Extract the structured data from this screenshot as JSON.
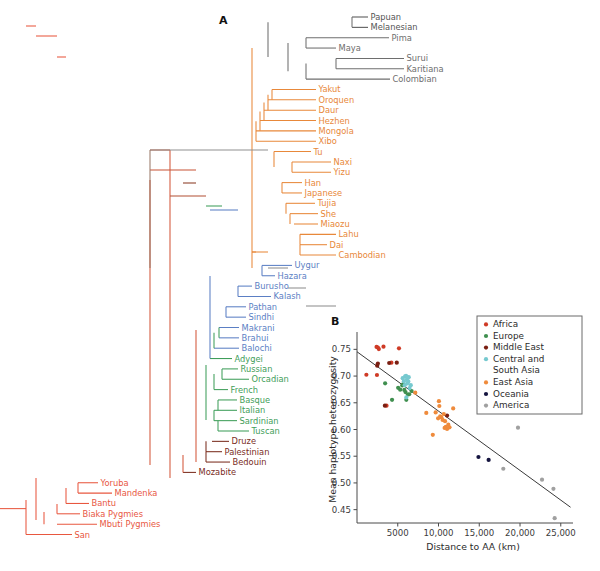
{
  "figure": {
    "panel_a_label": "A",
    "panel_b_label": "B"
  },
  "tree": {
    "regions": {
      "Africa": "#e8573f",
      "Europe": "#3f9e5a",
      "Middle East": "#7a2d1e",
      "Central and South Asia": "#5b7fc4",
      "East Asia": "#e8883a",
      "Oceania": "#555555",
      "America": "#6e6e6e"
    },
    "tips": [
      {
        "name": "Papuan",
        "region": "Oceania"
      },
      {
        "name": "Melanesian",
        "region": "Oceania"
      },
      {
        "name": "Pima",
        "region": "America"
      },
      {
        "name": "Maya",
        "region": "America"
      },
      {
        "name": "Surui",
        "region": "America"
      },
      {
        "name": "Karitiana",
        "region": "America"
      },
      {
        "name": "Colombian",
        "region": "America"
      },
      {
        "name": "Yakut",
        "region": "East Asia"
      },
      {
        "name": "Oroquen",
        "region": "East Asia"
      },
      {
        "name": "Daur",
        "region": "East Asia"
      },
      {
        "name": "Hezhen",
        "region": "East Asia"
      },
      {
        "name": "Mongola",
        "region": "East Asia"
      },
      {
        "name": "Xibo",
        "region": "East Asia"
      },
      {
        "name": "Tu",
        "region": "East Asia"
      },
      {
        "name": "Naxi",
        "region": "East Asia"
      },
      {
        "name": "Yizu",
        "region": "East Asia"
      },
      {
        "name": "Han",
        "region": "East Asia"
      },
      {
        "name": "Japanese",
        "region": "East Asia"
      },
      {
        "name": "Tujia",
        "region": "East Asia"
      },
      {
        "name": "She",
        "region": "East Asia"
      },
      {
        "name": "Miaozu",
        "region": "East Asia"
      },
      {
        "name": "Lahu",
        "region": "East Asia"
      },
      {
        "name": "Dai",
        "region": "East Asia"
      },
      {
        "name": "Cambodian",
        "region": "East Asia"
      },
      {
        "name": "Uygur",
        "region": "Central and South Asia"
      },
      {
        "name": "Hazara",
        "region": "Central and South Asia"
      },
      {
        "name": "Burusho",
        "region": "Central and South Asia"
      },
      {
        "name": "Kalash",
        "region": "Central and South Asia"
      },
      {
        "name": "Pathan",
        "region": "Central and South Asia"
      },
      {
        "name": "Sindhi",
        "region": "Central and South Asia"
      },
      {
        "name": "Makrani",
        "region": "Central and South Asia"
      },
      {
        "name": "Brahui",
        "region": "Central and South Asia"
      },
      {
        "name": "Balochi",
        "region": "Central and South Asia"
      },
      {
        "name": "Adygei",
        "region": "Europe"
      },
      {
        "name": "Russian",
        "region": "Europe"
      },
      {
        "name": "Orcadian",
        "region": "Europe"
      },
      {
        "name": "French",
        "region": "Europe"
      },
      {
        "name": "Basque",
        "region": "Europe"
      },
      {
        "name": "Italian",
        "region": "Europe"
      },
      {
        "name": "Sardinian",
        "region": "Europe"
      },
      {
        "name": "Tuscan",
        "region": "Europe"
      },
      {
        "name": "Druze",
        "region": "Middle East"
      },
      {
        "name": "Palestinian",
        "region": "Middle East"
      },
      {
        "name": "Bedouin",
        "region": "Middle East"
      },
      {
        "name": "Mozabite",
        "region": "Middle East"
      },
      {
        "name": "Yoruba",
        "region": "Africa"
      },
      {
        "name": "Mandenka",
        "region": "Africa"
      },
      {
        "name": "Bantu",
        "region": "Africa"
      },
      {
        "name": "Biaka Pygmies",
        "region": "Africa"
      },
      {
        "name": "Mbuti Pygmies",
        "region": "Africa"
      },
      {
        "name": "San",
        "region": "Africa"
      }
    ]
  },
  "chart_data": {
    "type": "scatter",
    "title": "",
    "xlabel": "Distance to AA (km)",
    "ylabel": "Mean haplotype heterozygosity",
    "xlim": [
      0,
      26500
    ],
    "ylim": [
      0.425,
      0.775
    ],
    "xticks": [
      5000,
      10000,
      15000,
      20000,
      25000
    ],
    "xtick_labels": [
      "5000",
      "10,000",
      "15,000",
      "20,000",
      "25,000"
    ],
    "yticks": [
      0.45,
      0.5,
      0.55,
      0.6,
      0.65,
      0.7,
      0.75
    ],
    "ytick_labels": [
      "0.45",
      "0.50",
      "0.55",
      "0.60",
      "0.65",
      "0.70",
      "0.75"
    ],
    "grid": false,
    "legend_position": "top-right",
    "trendline": {
      "x0": 0,
      "y0": 0.7455,
      "x1": 26200,
      "y1": 0.4545
    },
    "series": [
      {
        "name": "Africa",
        "color": "#cf3b26",
        "points": [
          [
            1150,
            0.7025
          ],
          [
            2400,
            0.7545
          ],
          [
            2560,
            0.7535
          ],
          [
            2680,
            0.7505
          ],
          [
            2450,
            0.702
          ],
          [
            3250,
            0.755
          ],
          [
            3620,
            0.6445
          ],
          [
            5150,
            0.752
          ],
          [
            4220,
            0.725
          ]
        ]
      },
      {
        "name": "Europe",
        "color": "#3f8f4f",
        "points": [
          [
            3450,
            0.6865
          ],
          [
            4300,
            0.6555
          ],
          [
            5050,
            0.678
          ],
          [
            5300,
            0.6745
          ],
          [
            5550,
            0.6825
          ],
          [
            5800,
            0.674
          ],
          [
            5950,
            0.67
          ],
          [
            6250,
            0.6655
          ],
          [
            6050,
            0.6555
          ],
          [
            6400,
            0.666
          ],
          [
            5650,
            0.6845
          ],
          [
            6700,
            0.672
          ]
        ]
      },
      {
        "name": "Middle East",
        "color": "#7a1f12",
        "points": [
          [
            2480,
            0.7195
          ],
          [
            2560,
            0.7235
          ],
          [
            3950,
            0.7245
          ],
          [
            4880,
            0.725
          ],
          [
            3420,
            0.6445
          ],
          [
            11050,
            0.626
          ]
        ]
      },
      {
        "name": "Central and South Asia",
        "color": "#76c9cf",
        "points": [
          [
            5600,
            0.696
          ],
          [
            5750,
            0.6905
          ],
          [
            5900,
            0.6995
          ],
          [
            6020,
            0.7005
          ],
          [
            6120,
            0.6935
          ],
          [
            6180,
            0.6865
          ],
          [
            6300,
            0.69
          ],
          [
            5850,
            0.683
          ],
          [
            6450,
            0.6775
          ],
          [
            6050,
            0.66
          ],
          [
            6600,
            0.683
          ],
          [
            6350,
            0.698
          ]
        ]
      },
      {
        "name": "East Asia",
        "color": "#ef8b3c",
        "points": [
          [
            7150,
            0.669
          ],
          [
            8500,
            0.631
          ],
          [
            9300,
            0.59
          ],
          [
            9650,
            0.632
          ],
          [
            10050,
            0.653
          ],
          [
            10200,
            0.6245
          ],
          [
            10350,
            0.623
          ],
          [
            10500,
            0.618
          ],
          [
            10650,
            0.629
          ],
          [
            10800,
            0.6155
          ],
          [
            10900,
            0.605
          ],
          [
            11050,
            0.601
          ],
          [
            11200,
            0.609
          ],
          [
            11800,
            0.6395
          ],
          [
            10100,
            0.644
          ],
          [
            9950,
            0.621
          ],
          [
            10750,
            0.603
          ],
          [
            11350,
            0.604
          ]
        ]
      },
      {
        "name": "Oceania",
        "color": "#15143f",
        "points": [
          [
            14900,
            0.5485
          ],
          [
            16150,
            0.543
          ]
        ]
      },
      {
        "name": "America",
        "color": "#a0a0a0",
        "points": [
          [
            17950,
            0.5265
          ],
          [
            19750,
            0.6035
          ],
          [
            22700,
            0.506
          ],
          [
            24100,
            0.489
          ],
          [
            24250,
            0.434
          ]
        ]
      }
    ],
    "legend": [
      {
        "label": "Africa",
        "color": "#cf3b26"
      },
      {
        "label": "Europe",
        "color": "#3f8f4f"
      },
      {
        "label": "Middle East",
        "color": "#7a1f12"
      },
      {
        "label": "Central and",
        "color": "#76c9cf"
      },
      {
        "label": "South Asia",
        "color": null
      },
      {
        "label": "East Asia",
        "color": "#ef8b3c"
      },
      {
        "label": "Oceania",
        "color": "#15143f"
      },
      {
        "label": "America",
        "color": "#a0a0a0"
      }
    ]
  }
}
